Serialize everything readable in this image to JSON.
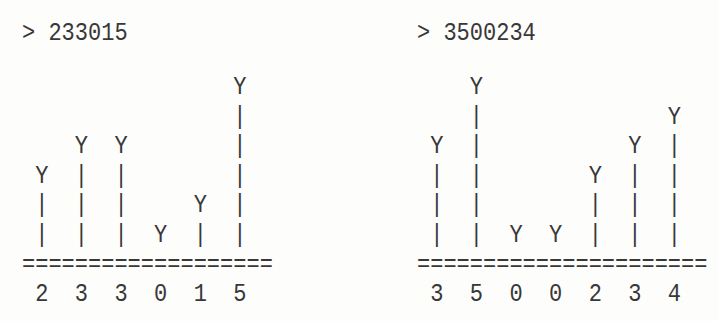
{
  "page": {
    "background": "#fdfdfc",
    "text_color": "#383838"
  },
  "charts": [
    {
      "title": "> 233015",
      "input_number": "233015",
      "rows": [
        "                Y",
        "                |",
        "    Y  Y        |",
        " Y  |  |        |",
        " |  |  |     Y  |",
        " |  |  |  Y  |  |"
      ],
      "baseline": "===================",
      "digit_labels": " 2  3  3  0  1  5"
    },
    {
      "title": "> 3500234",
      "input_number": "3500234",
      "rows": [
        "    Y",
        "    |              Y",
        " Y  |           Y  |",
        " |  |        Y  |  |",
        " |  |        |  |  |",
        " |  |  Y  Y  |  |  |"
      ],
      "baseline": "======================",
      "digit_labels": " 3  5  0  0  2  3  4"
    }
  ],
  "chart_data": [
    {
      "type": "bar",
      "title": "> 233015",
      "categories": [
        "2",
        "3",
        "3",
        "0",
        "1",
        "5"
      ],
      "values": [
        2,
        3,
        3,
        0,
        1,
        5
      ],
      "xlabel": "",
      "ylabel": "",
      "ylim": [
        0,
        6
      ],
      "grid": false,
      "legend": "none",
      "render_style": "ascii bar chart: each bar is a 'Y' cap above N '|' stems standing on an '=' baseline; bar height N equals the digit value; digits printed under the baseline"
    },
    {
      "type": "bar",
      "title": "> 3500234",
      "categories": [
        "3",
        "5",
        "0",
        "0",
        "2",
        "3",
        "4"
      ],
      "values": [
        3,
        5,
        0,
        0,
        2,
        3,
        4
      ],
      "xlabel": "",
      "ylabel": "",
      "ylim": [
        0,
        6
      ],
      "grid": false,
      "legend": "none",
      "render_style": "ascii bar chart: each bar is a 'Y' cap above N '|' stems standing on an '=' baseline; bar height N equals the digit value; digits printed under the baseline"
    }
  ]
}
